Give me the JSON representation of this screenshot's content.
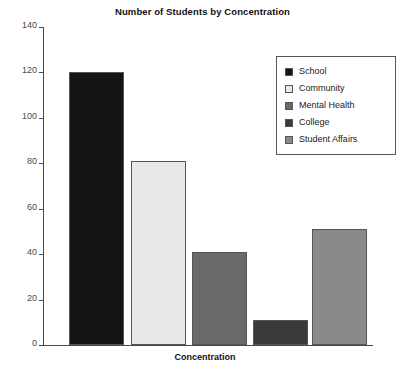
{
  "chart_data": {
    "type": "bar",
    "title": "Number of Students by Concentration",
    "xlabel": "Concentration",
    "ylabel": "",
    "categories": [
      "School",
      "Community",
      "Mental Health",
      "College",
      "Student Affairs"
    ],
    "values": [
      120,
      81,
      41,
      11,
      51
    ],
    "ylim": [
      0,
      140
    ],
    "yticks": [
      0,
      20,
      40,
      60,
      80,
      100,
      120,
      140
    ],
    "ytick_labels": [
      "0",
      "20",
      "40",
      "60",
      "80",
      "100",
      "120",
      "140"
    ],
    "grid": false,
    "legend_position": "top-right",
    "legend": [
      {
        "label": "School",
        "color": "#141414"
      },
      {
        "label": "Community",
        "color": "#e8e8e8"
      },
      {
        "label": "Mental Health",
        "color": "#6a6a6a"
      },
      {
        "label": "College",
        "color": "#3a3a3a"
      },
      {
        "label": "Student Affairs",
        "color": "#8a8a8a"
      }
    ],
    "bar_edge_color": "#555555",
    "axis_color": "#4a4a4a",
    "background_color": "#ffffff"
  }
}
